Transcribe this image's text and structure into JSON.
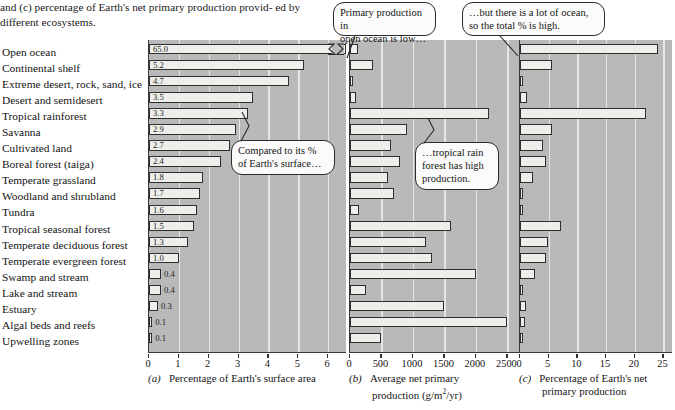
{
  "caption": {
    "line1": "and (c) percentage of Earth's net primary production provid-",
    "line2": "ed by different ecosystems."
  },
  "ecosystems": [
    "Open ocean",
    "Continental shelf",
    "Extreme desert, rock, sand, ice",
    "Desert and semidesert",
    "Tropical rainforest",
    "Savanna",
    "Cultivated land",
    "Boreal forest (taiga)",
    "Temperate grassland",
    "Woodland and shrubland",
    "Tundra",
    "Tropical seasonal forest",
    "Temperate deciduous forest",
    "Temperate evergreen forest",
    "Swamp and stream",
    "Lake and stream",
    "Estuary",
    "Algal beds and reefs",
    "Upwelling zones"
  ],
  "callouts": [
    {
      "name": "callout-open-ocean-low",
      "line1": "Primary production in",
      "line2": "open ocean is low…"
    },
    {
      "name": "callout-total-high",
      "line1": "…but there is a lot of ocean,",
      "line2": "so the total % is high."
    },
    {
      "name": "callout-compared-surface",
      "line1": "Compared to its %",
      "line2": "of Earth's surface…"
    },
    {
      "name": "callout-rainforest-high",
      "line1": "…tropical rain",
      "line2": "forest has high",
      "line3": "production."
    }
  ],
  "chart_data": [
    {
      "panel": "a",
      "type": "bar",
      "orientation": "horizontal",
      "panel_letter": "(a)",
      "title": "Percentage of Earth's surface area",
      "xlabel": "Percentage of Earth's surface area",
      "ylabel": "",
      "xlim": [
        0,
        6.6
      ],
      "ticks": [
        0,
        1,
        2,
        3,
        4,
        5,
        6
      ],
      "tick_labels": [
        "0",
        "1",
        "2",
        "3",
        "4",
        "5",
        "6"
      ],
      "grid": true,
      "axis_break": true,
      "axis_break_note": "Open ocean bar (65.0) is truncated with a break symbol",
      "data_labels_shown": true,
      "categories": [
        "Open ocean",
        "Continental shelf",
        "Extreme desert, rock, sand, ice",
        "Desert and semidesert",
        "Tropical rainforest",
        "Savanna",
        "Cultivated land",
        "Boreal forest (taiga)",
        "Temperate grassland",
        "Woodland and shrubland",
        "Tundra",
        "Tropical seasonal forest",
        "Temperate deciduous forest",
        "Temperate evergreen forest",
        "Swamp and stream",
        "Lake and stream",
        "Estuary",
        "Algal beds and reefs",
        "Upwelling zones"
      ],
      "values": [
        65.0,
        5.2,
        4.7,
        3.5,
        3.3,
        2.9,
        2.7,
        2.4,
        1.8,
        1.7,
        1.6,
        1.5,
        1.3,
        1.0,
        0.4,
        0.4,
        0.3,
        0.1,
        0.1
      ],
      "value_labels": [
        "65.0",
        "5.2",
        "4.7",
        "3.5",
        "3.3",
        "2.9",
        "2.7",
        "2.4",
        "1.8",
        "1.7",
        "1.6",
        "1.5",
        "1.3",
        "1.0",
        "0.4",
        "0.4",
        "0.3",
        "0.1",
        "0.1"
      ]
    },
    {
      "panel": "b",
      "type": "bar",
      "orientation": "horizontal",
      "panel_letter": "(b)",
      "title": "Average net primary production (g/m2/yr)",
      "xlabel_line1": "Average net primary",
      "xlabel_line2_pre": "production (g/m",
      "xlabel_line2_sup": "2",
      "xlabel_line2_post": "/yr)",
      "xlim": [
        0,
        2700
      ],
      "ticks": [
        0,
        500,
        1000,
        1500,
        2000,
        2500
      ],
      "tick_labels": [
        "0",
        "500",
        "1000",
        "1500",
        "2000",
        "2500"
      ],
      "grid": true,
      "data_labels_shown": false,
      "categories": [
        "Open ocean",
        "Continental shelf",
        "Extreme desert, rock, sand, ice",
        "Desert and semidesert",
        "Tropical rainforest",
        "Savanna",
        "Cultivated land",
        "Boreal forest (taiga)",
        "Temperate grassland",
        "Woodland and shrubland",
        "Tundra",
        "Tropical seasonal forest",
        "Temperate deciduous forest",
        "Temperate evergreen forest",
        "Swamp and stream",
        "Lake and stream",
        "Estuary",
        "Algal beds and reefs",
        "Upwelling zones"
      ],
      "values": [
        125,
        360,
        3,
        90,
        2200,
        900,
        650,
        800,
        600,
        700,
        140,
        1600,
        1200,
        1300,
        2000,
        250,
        1500,
        2500,
        500
      ]
    },
    {
      "panel": "c",
      "type": "bar",
      "orientation": "horizontal",
      "panel_letter": "(c)",
      "title": "Percentage of Earth's net primary production",
      "xlabel_line1": "Percentage of Earth's net",
      "xlabel_line2": "primary production",
      "xlim": [
        0,
        26.5
      ],
      "ticks": [
        0,
        5,
        10,
        15,
        20,
        25
      ],
      "tick_labels": [
        "0",
        "5",
        "10",
        "15",
        "20",
        "25"
      ],
      "grid": true,
      "data_labels_shown": false,
      "categories": [
        "Open ocean",
        "Continental shelf",
        "Extreme desert, rock, sand, ice",
        "Desert and semidesert",
        "Tropical rainforest",
        "Savanna",
        "Cultivated land",
        "Boreal forest (taiga)",
        "Temperate grassland",
        "Woodland and shrubland",
        "Tundra",
        "Tropical seasonal forest",
        "Temperate deciduous forest",
        "Temperate evergreen forest",
        "Swamp and stream",
        "Lake and stream",
        "Estuary",
        "Algal beds and reefs",
        "Upwelling zones"
      ],
      "values": [
        24.0,
        5.5,
        0.1,
        1.3,
        22.0,
        5.5,
        4.0,
        4.5,
        2.2,
        0.6,
        0.4,
        7.1,
        4.9,
        4.5,
        2.6,
        0.3,
        1.1,
        0.9,
        0.2
      ]
    }
  ]
}
